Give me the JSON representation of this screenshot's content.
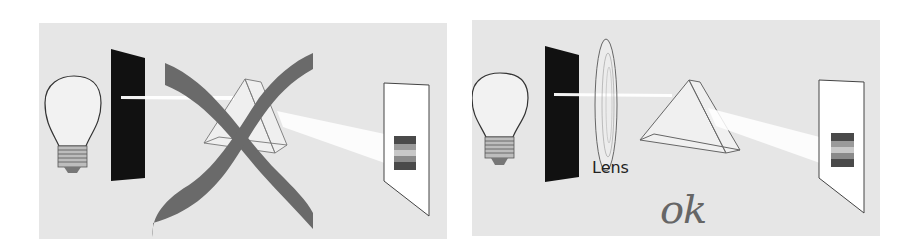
{
  "figure": {
    "panels": [
      {
        "id": "left",
        "status": "incorrect",
        "status_mark": "cross-out",
        "components": [
          "light-bulb",
          "slit-screen",
          "prism",
          "projection-screen"
        ]
      },
      {
        "id": "right",
        "status": "correct",
        "status_label": "ok",
        "lens_label": "Lens",
        "components": [
          "light-bulb",
          "slit-screen",
          "lens",
          "prism",
          "projection-screen"
        ]
      }
    ],
    "colors": {
      "panel_background": "#e6e6e6",
      "slit_screen": "#111111",
      "cross_mark": "#6a6a6a",
      "ok_label": "#666666",
      "beam": "#ffffff",
      "spectrum": [
        "#4a4a4a",
        "#9a9a9a",
        "#c8c8c8",
        "#8a8a8a",
        "#4a4a4a"
      ]
    }
  }
}
